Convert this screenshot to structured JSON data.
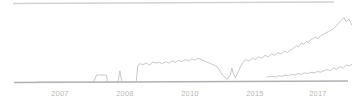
{
  "chart_data": {
    "type": "line",
    "title": "",
    "subtitle": "",
    "xlabel": "",
    "ylabel": "",
    "grid": false,
    "legend": "none",
    "axis_color": "#b0b0b0",
    "series_colors": [
      "#c2c2c2",
      "#c2c2c2"
    ],
    "xlim": [
      2006.1,
      2018.4
    ],
    "ylim": [
      0,
      100
    ],
    "x_tick_labels": [
      "2007",
      "2008",
      "2010",
      "2015",
      "2017"
    ],
    "x_tick_values": [
      2007,
      2008,
      2010,
      2015,
      2017
    ],
    "top_rule": true,
    "series": [
      {
        "name": "series-1",
        "x": [
          2006.1,
          2008.3,
          2008.42,
          2008.45,
          2008.8,
          2008.84,
          2008.95,
          2009.25,
          2009.32,
          2009.4,
          2009.55,
          2009.95,
          2010.02,
          2010.1,
          2010.22,
          2010.35,
          2010.48,
          2010.6,
          2010.72,
          2010.85,
          2010.98,
          2011.1,
          2011.22,
          2011.35,
          2011.48,
          2011.6,
          2011.72,
          2011.85,
          2011.98,
          2012.1,
          2012.22,
          2012.35,
          2012.48,
          2012.6,
          2012.72,
          2012.85,
          2012.98,
          2013.1,
          2013.22,
          2013.35,
          2013.48,
          2013.6,
          2013.66,
          2013.72,
          2013.8,
          2013.95,
          2014.08,
          2014.2,
          2014.32,
          2014.45,
          2014.58,
          2014.7,
          2014.82,
          2014.95,
          2015.08,
          2015.2,
          2015.32,
          2015.45,
          2015.58,
          2015.7,
          2015.82,
          2015.95,
          2016.05,
          2016.15,
          2016.25,
          2016.35,
          2016.45,
          2016.55,
          2016.62,
          2016.7,
          2016.8,
          2016.9,
          2017.0,
          2017.1,
          2017.2,
          2017.3,
          2017.4,
          2017.5,
          2017.6,
          2017.7,
          2017.8,
          2017.9,
          2018.0,
          2018.1,
          2018.2,
          2018.3
        ],
        "y": [
          0,
          0,
          10,
          10,
          10,
          0,
          0,
          0,
          16,
          0,
          0,
          0,
          24,
          26,
          25,
          27,
          24,
          29,
          27,
          28,
          26,
          29,
          27,
          30,
          28,
          31,
          29,
          32,
          30,
          33,
          31,
          34,
          32,
          30,
          28,
          26,
          24,
          22,
          14,
          8,
          4,
          10,
          20,
          12,
          6,
          18,
          28,
          32,
          30,
          34,
          32,
          36,
          34,
          38,
          36,
          40,
          38,
          42,
          40,
          44,
          42,
          46,
          48,
          52,
          50,
          56,
          54,
          58,
          56,
          60,
          62,
          64,
          62,
          66,
          68,
          70,
          72,
          74,
          76,
          80,
          84,
          88,
          92,
          86,
          90,
          82
        ]
      },
      {
        "name": "series-2",
        "x": [
          2015.02,
          2015.12,
          2015.22,
          2015.35,
          2015.48,
          2015.6,
          2015.72,
          2015.85,
          2015.98,
          2016.1,
          2016.22,
          2016.35,
          2016.48,
          2016.6,
          2016.72,
          2016.85,
          2016.98,
          2017.1,
          2017.22,
          2017.35,
          2017.48,
          2017.6,
          2017.72,
          2017.85,
          2017.98,
          2018.1,
          2018.2,
          2018.3
        ],
        "y": [
          7,
          8,
          8,
          7,
          9,
          8,
          10,
          9,
          11,
          10,
          12,
          11,
          13,
          12,
          14,
          13,
          15,
          14,
          16,
          18,
          16,
          20,
          18,
          22,
          20,
          24,
          23,
          25
        ]
      }
    ]
  }
}
